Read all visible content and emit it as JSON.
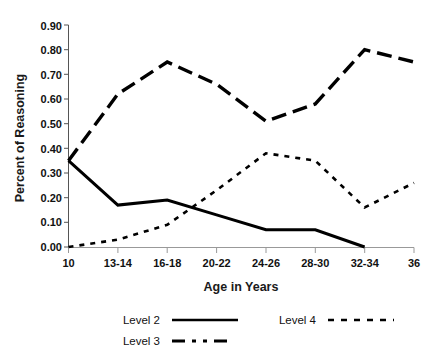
{
  "chart_data": {
    "type": "line",
    "title": "",
    "xlabel": "Age in Years",
    "ylabel": "Percent of Reasoning",
    "categories": [
      "10",
      "13-14",
      "16-18",
      "20-22",
      "24-26",
      "28-30",
      "32-34",
      "36"
    ],
    "xtick_labels": [
      "10",
      "13-14",
      "16-18",
      "20-22",
      "24-26",
      "28-30",
      "32-34",
      "36"
    ],
    "ytick_labels": [
      "0.00",
      "0.10",
      "0.20",
      "0.30",
      "0.40",
      "0.50",
      "0.60",
      "0.70",
      "0.80",
      "0.90"
    ],
    "ylim": [
      0.0,
      0.9
    ],
    "ytick_values": [
      0.0,
      0.1,
      0.2,
      0.3,
      0.4,
      0.5,
      0.6,
      0.7,
      0.8,
      0.9
    ],
    "grid": false,
    "legend_position": "bottom",
    "series": [
      {
        "name": "Level 2",
        "style": "solid",
        "color": "#000000",
        "values": [
          0.35,
          0.17,
          0.19,
          0.13,
          0.07,
          0.07,
          0.0,
          null
        ]
      },
      {
        "name": "Level 3",
        "style": "dash-long",
        "color": "#000000",
        "values": [
          0.35,
          0.62,
          0.75,
          0.66,
          0.51,
          0.58,
          0.8,
          0.75
        ]
      },
      {
        "name": "Level 4",
        "style": "dash-short",
        "color": "#000000",
        "values": [
          0.0,
          0.03,
          0.09,
          0.23,
          0.38,
          0.35,
          0.16,
          0.26
        ]
      }
    ]
  },
  "legend": {
    "entries": [
      {
        "label": "Level 2",
        "style": "solid"
      },
      {
        "label": "Level 3",
        "style": "dash-long"
      },
      {
        "label": "Level 4",
        "style": "dash-short"
      }
    ]
  }
}
